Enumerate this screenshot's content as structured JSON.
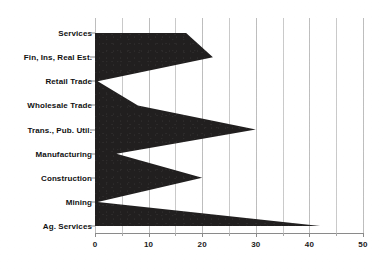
{
  "chart_data": {
    "type": "area",
    "orientation": "horizontal",
    "title": "",
    "subtitle": "",
    "xlabel": "",
    "ylabel": "",
    "categories": [
      "Services",
      "Fin, Ins, Real Est.",
      "Retail Trade",
      "Wholesale Trade",
      "Trans., Pub. Util.",
      "Manufacturing",
      "Construction",
      "Mining",
      "Ag. Services"
    ],
    "values": [
      17,
      22,
      0.5,
      8,
      30,
      4,
      20,
      0.5,
      42
    ],
    "series": [
      {
        "name": "",
        "values": [
          17,
          22,
          0.5,
          8,
          30,
          4,
          20,
          0.5,
          42
        ]
      }
    ],
    "xlim": [
      0,
      50
    ],
    "xticks": [
      0,
      10,
      20,
      30,
      40,
      50
    ],
    "xtick_labels": [
      "0",
      "10",
      "20",
      "30",
      "40",
      "50"
    ],
    "xticks_minor": [
      5,
      15,
      25,
      35,
      45
    ],
    "grid": true,
    "grid_axis": "x",
    "legend": false,
    "legend_position": "none",
    "fill_color": "#211f1f",
    "grid_color": "#c9c9c9",
    "axis_color": "#8a8a8a",
    "text_color": "#111111",
    "background_color": "#ffffff",
    "annotations": []
  }
}
